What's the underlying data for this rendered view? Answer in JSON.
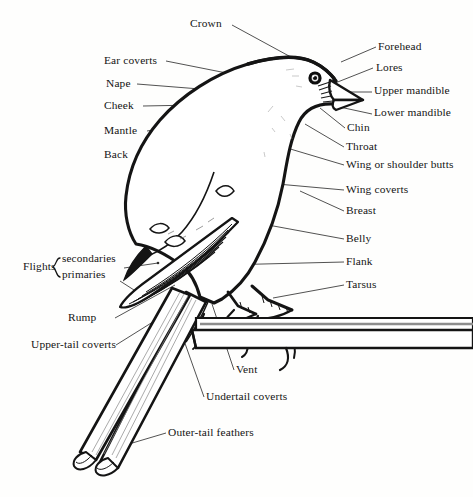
{
  "diagram": {
    "style": "black-and-white pen-and-ink line drawing with leader lines to labels",
    "background_color": "#fefefd",
    "ink_color": "#141414"
  },
  "labels": {
    "crown": "Crown",
    "forehead": "Forehead",
    "lores": "Lores",
    "upper_mandible": "Upper mandible",
    "lower_mandible": "Lower mandible",
    "chin": "Chin",
    "throat": "Throat",
    "wing_or_shoulder_butts": "Wing or shoulder butts",
    "wing_coverts": "Wing coverts",
    "breast": "Breast",
    "belly": "Belly",
    "flank": "Flank",
    "tarsus": "Tarsus",
    "ear_coverts": "Ear coverts",
    "nape": "Nape",
    "cheek": "Cheek",
    "mantle": "Mantle",
    "back": "Back",
    "flights": "Flights",
    "secondaries": "secondaries",
    "primaries": "primaries",
    "rump": "Rump",
    "upper_tail_coverts": "Upper-tail coverts",
    "vent": "Vent",
    "undertail_coverts": "Undertail coverts",
    "outer_tail_feathers": "Outer-tail feathers",
    "brace_glyph": "{"
  },
  "label_groups": {
    "left_column": [
      "Ear coverts",
      "Nape",
      "Cheek",
      "Mantle",
      "Back",
      "Flights",
      "Rump",
      "Upper-tail coverts"
    ],
    "flights_bracket_members": [
      "secondaries",
      "primaries"
    ],
    "right_column": [
      "Forehead",
      "Lores",
      "Upper mandible",
      "Lower mandible",
      "Chin",
      "Throat",
      "Wing or shoulder butts",
      "Wing coverts",
      "Breast",
      "Belly",
      "Flank",
      "Tarsus"
    ],
    "top": [
      "Crown"
    ],
    "bottom": [
      "Vent",
      "Undertail coverts",
      "Outer-tail feathers"
    ]
  },
  "anatomy_parts_total": 26
}
